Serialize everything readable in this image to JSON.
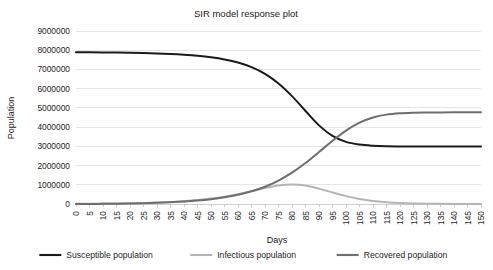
{
  "chart_data": {
    "type": "line",
    "title": "SIR model response plot",
    "xlabel": "Days",
    "ylabel": "Population",
    "xlim": [
      0,
      150
    ],
    "ylim": [
      0,
      9000000
    ],
    "grid": true,
    "legend_position": "bottom",
    "x_ticks": [
      0,
      5,
      10,
      15,
      20,
      25,
      30,
      35,
      40,
      45,
      50,
      55,
      60,
      65,
      70,
      75,
      80,
      85,
      90,
      95,
      100,
      105,
      110,
      115,
      120,
      125,
      130,
      135,
      140,
      145,
      150
    ],
    "x_tick_labels": [
      "0",
      "5",
      "10",
      "15",
      "20",
      "25",
      "30",
      "35",
      "40",
      "45",
      "50",
      "55",
      "60",
      "65",
      "70",
      "75",
      "80",
      "85",
      "90",
      "95",
      "100",
      "105",
      "110",
      "115",
      "120",
      "125",
      "130",
      "135",
      "140",
      "145",
      "150"
    ],
    "y_ticks": [
      0,
      1000000,
      2000000,
      3000000,
      4000000,
      5000000,
      6000000,
      7000000,
      8000000,
      9000000
    ],
    "y_tick_labels": [
      "0",
      "1000000",
      "2000000",
      "3000000",
      "4000000",
      "5000000",
      "6000000",
      "7000000",
      "8000000",
      "9000000"
    ],
    "x": [
      0,
      5,
      10,
      15,
      20,
      25,
      30,
      35,
      40,
      45,
      50,
      55,
      60,
      65,
      70,
      75,
      80,
      85,
      90,
      95,
      100,
      105,
      110,
      115,
      120,
      125,
      130,
      135,
      140,
      145,
      150
    ],
    "series": [
      {
        "name": "Susceptible population",
        "color": "#1a1a1a",
        "width": 2.0,
        "values": [
          7900000,
          7895000,
          7888000,
          7878000,
          7866000,
          7850000,
          7828000,
          7800000,
          7760000,
          7706000,
          7630000,
          7520000,
          7360000,
          7120000,
          6770000,
          6270000,
          5610000,
          4840000,
          4090000,
          3540000,
          3230000,
          3090000,
          3030000,
          3005000,
          2995000,
          2990000,
          2988000,
          2987000,
          2986000,
          2985000,
          2985000
        ]
      },
      {
        "name": "Infectious population",
        "color": "#b4b4b4",
        "width": 2.0,
        "values": [
          10000,
          14000,
          20000,
          28000,
          39000,
          55000,
          77000,
          107000,
          149000,
          206000,
          283000,
          384000,
          513000,
          667000,
          830000,
          965000,
          1020000,
          960000,
          800000,
          600000,
          410000,
          260000,
          155000,
          90000,
          50000,
          28000,
          15000,
          8000,
          4000,
          2000,
          1000
        ]
      },
      {
        "name": "Recovered population",
        "color": "#6e6e6e",
        "width": 2.0,
        "values": [
          0,
          3000,
          8000,
          15000,
          25000,
          40000,
          60000,
          88000,
          126000,
          178000,
          250000,
          348000,
          480000,
          660000,
          900000,
          1220000,
          1630000,
          2130000,
          2700000,
          3290000,
          3820000,
          4230000,
          4500000,
          4650000,
          4720000,
          4750000,
          4762000,
          4766000,
          4768000,
          4769000,
          4770000
        ]
      }
    ],
    "legend": [
      {
        "label": "Susceptible population",
        "color": "#1a1a1a"
      },
      {
        "label": "Infectious population",
        "color": "#b4b4b4"
      },
      {
        "label": "Recovered population",
        "color": "#6e6e6e"
      }
    ]
  }
}
